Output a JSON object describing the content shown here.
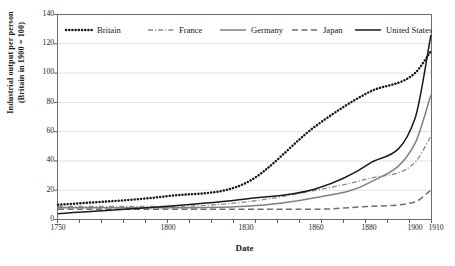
{
  "chart_data": {
    "type": "line",
    "title": "",
    "xlabel": "Date",
    "ylabel_line1": "Industrial output per person",
    "ylabel_line2": "(Britain in 1900 = 100)",
    "x": [
      1750,
      1800,
      1830,
      1860,
      1880,
      1900,
      1910
    ],
    "xtick_labels": [
      "1750",
      "1800",
      "1830",
      "1860",
      "1880",
      "1900",
      "1910"
    ],
    "xlim": [
      1750,
      1910
    ],
    "ylim": [
      0,
      140
    ],
    "ytick_labels": [
      "0",
      "20",
      "40",
      "60",
      "80",
      "100",
      "120",
      "140"
    ],
    "ytick_values": [
      0,
      20,
      40,
      60,
      80,
      100,
      120,
      140
    ],
    "grid": "horizontal",
    "legend_position": "top-inside",
    "series": [
      {
        "name": "Britain",
        "style": "dotted",
        "color": "#1a1a1a",
        "values": [
          10,
          16,
          25,
          64,
          87,
          100,
          115
        ]
      },
      {
        "name": "France",
        "style": "dash-dot",
        "color": "#8c8c8c",
        "values": [
          9,
          9,
          12,
          20,
          28,
          39,
          57
        ]
      },
      {
        "name": "Germany",
        "style": "solid",
        "color": "#808080",
        "values": [
          8,
          8,
          9,
          15,
          25,
          52,
          85
        ]
      },
      {
        "name": "Japan",
        "style": "dashed",
        "color": "#6e6e6e",
        "values": [
          7,
          7,
          7,
          7,
          9,
          12,
          20
        ]
      },
      {
        "name": "United States",
        "style": "solid",
        "color": "#1a1a1a",
        "values": [
          4,
          9,
          14,
          21,
          38,
          69,
          126
        ]
      }
    ]
  }
}
